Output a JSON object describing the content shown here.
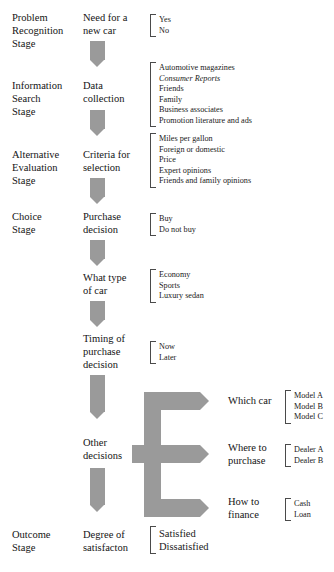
{
  "diagram": {
    "arrow_color": "#9a9a9a",
    "stages": [
      {
        "label": "Problem\nRecognition\nStage"
      },
      {
        "label": "Information\nSearch\nStage"
      },
      {
        "label": "Alternative\nEvaluation\nStage"
      },
      {
        "label": "Choice\nStage"
      },
      {
        "label": "Outcome\nStage"
      }
    ],
    "nodes": [
      {
        "label": "Need for a\nnew car",
        "options": [
          {
            "text": "Yes",
            "italic": false
          },
          {
            "text": "No",
            "italic": false
          }
        ]
      },
      {
        "label": "Data\ncollection",
        "options": [
          {
            "text": "Automotive magazines",
            "italic": false
          },
          {
            "text": "Consumer Reports",
            "italic": true
          },
          {
            "text": "Friends",
            "italic": false
          },
          {
            "text": "Family",
            "italic": false
          },
          {
            "text": "Business associates",
            "italic": false
          },
          {
            "text": "Promotion literature and ads",
            "italic": false
          }
        ]
      },
      {
        "label": "Criteria for\nselection",
        "options": [
          {
            "text": "Miles per gallon",
            "italic": false
          },
          {
            "text": "Foreign or domestic",
            "italic": false
          },
          {
            "text": "Price",
            "italic": false
          },
          {
            "text": "Expert opinions",
            "italic": false
          },
          {
            "text": "Friends and family opinions",
            "italic": false
          }
        ]
      },
      {
        "label": "Purchase\ndecision",
        "options": [
          {
            "text": "Buy",
            "italic": false
          },
          {
            "text": "Do not buy",
            "italic": false
          }
        ]
      },
      {
        "label": "What type\nof car",
        "options": [
          {
            "text": "Economy",
            "italic": false
          },
          {
            "text": "Sports",
            "italic": false
          },
          {
            "text": "Luxury sedan",
            "italic": false
          }
        ]
      },
      {
        "label": "Timing of\npurchase\ndecision",
        "options": [
          {
            "text": "Now",
            "italic": false
          },
          {
            "text": "Later",
            "italic": false
          }
        ]
      },
      {
        "label": "Other\ndecisions",
        "options": []
      },
      {
        "label": "Degree of\nsatisfacton",
        "options": [
          {
            "text": "Satisfied",
            "italic": false
          },
          {
            "text": "Dissatisfied",
            "italic": false
          }
        ]
      }
    ],
    "branches": [
      {
        "label": "Which car",
        "options": [
          {
            "text": "Model A",
            "italic": false
          },
          {
            "text": "Model B",
            "italic": false
          },
          {
            "text": "Model C",
            "italic": false
          }
        ]
      },
      {
        "label": "Where to\npurchase",
        "options": [
          {
            "text": "Dealer A",
            "italic": false
          },
          {
            "text": "Dealer B",
            "italic": false
          }
        ]
      },
      {
        "label": "How to\nfinance",
        "options": [
          {
            "text": "Cash",
            "italic": false
          },
          {
            "text": "Loan",
            "italic": false
          }
        ]
      }
    ]
  }
}
